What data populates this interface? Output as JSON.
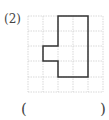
{
  "problem": {
    "number_label": "(2)",
    "answer_open": "(",
    "answer_close": ")",
    "answer_value": ""
  },
  "grid": {
    "columns": 5,
    "rows": 5,
    "cell_size_px": 15,
    "origin": [
      28,
      16
    ],
    "line_color": "#cccccc",
    "shape_color": "#333333",
    "shape_vertices_cells": [
      [
        2,
        0
      ],
      [
        4,
        0
      ],
      [
        4,
        4
      ],
      [
        2,
        4
      ],
      [
        2,
        3
      ],
      [
        1,
        3
      ],
      [
        1,
        2
      ],
      [
        2,
        2
      ]
    ]
  }
}
